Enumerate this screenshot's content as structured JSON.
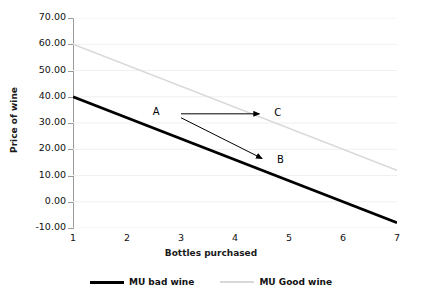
{
  "chart_data": {
    "type": "line",
    "title": "",
    "xlabel": "Bottles purchased",
    "ylabel": "Price of wine",
    "x": [
      1,
      2,
      3,
      4,
      5,
      6,
      7
    ],
    "xlim": [
      1,
      7
    ],
    "ylim": [
      -10,
      70
    ],
    "yticks": [
      "-10.00",
      "0.00",
      "10.00",
      "20.00",
      "30.00",
      "40.00",
      "50.00",
      "60.00",
      "70.00"
    ],
    "ytick_values": [
      -10,
      0,
      10,
      20,
      30,
      40,
      50,
      60,
      70
    ],
    "xticks": [
      "1",
      "2",
      "3",
      "4",
      "5",
      "6",
      "7"
    ],
    "grid": true,
    "legend_position": "bottom",
    "series": [
      {
        "name": "MU bad wine",
        "color": "#000000",
        "endpoints": [
          [
            1,
            40
          ],
          [
            7,
            -8
          ]
        ],
        "values": [
          40,
          32,
          24,
          16,
          8,
          0,
          -8
        ]
      },
      {
        "name": "MU Good wine",
        "color": "#d8d8d8",
        "endpoints": [
          [
            1,
            60
          ],
          [
            7,
            12
          ]
        ],
        "values": [
          60,
          52,
          44,
          36,
          28,
          20,
          12
        ]
      }
    ],
    "annotations": [
      {
        "label": "A",
        "x": 2.55,
        "y": 34
      },
      {
        "label": "C",
        "x": 4.8,
        "y": 33.5
      },
      {
        "label": "B",
        "x": 4.85,
        "y": 15.5
      }
    ],
    "arrows": [
      {
        "from": "A",
        "to": "C",
        "x0": 3.0,
        "y0": 33.5,
        "x1": 4.45,
        "y1": 33.5
      },
      {
        "from": "A",
        "to": "B",
        "x0": 3.0,
        "y0": 32.0,
        "x1": 4.5,
        "y1": 16.5
      }
    ]
  },
  "legend": {
    "items": [
      {
        "label": "MU bad wine"
      },
      {
        "label": "MU Good wine"
      }
    ]
  }
}
